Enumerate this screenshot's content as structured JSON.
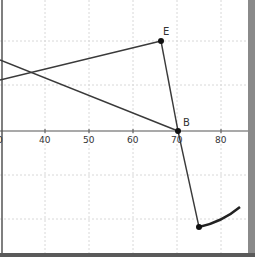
{
  "graph": {
    "x_axis": {
      "ticks": [
        {
          "label": "0",
          "x": 2
        },
        {
          "label": "40",
          "x": 45
        },
        {
          "label": "50",
          "x": 89
        },
        {
          "label": "60",
          "x": 133
        },
        {
          "label": "70",
          "x": 177
        },
        {
          "label": "80",
          "x": 221
        }
      ]
    },
    "points": [
      {
        "name": "E",
        "label": "E",
        "x": 161,
        "y": 41
      },
      {
        "name": "B",
        "label": "B",
        "x": 178,
        "y": 131
      },
      {
        "name": "C",
        "label": "",
        "x": 199,
        "y": 227
      }
    ],
    "colors": {
      "line": "#3a3a3a",
      "grid": "#d6d6d6",
      "axis": "#555555",
      "point": "#111111",
      "gutter": "#8a8a8a"
    }
  }
}
